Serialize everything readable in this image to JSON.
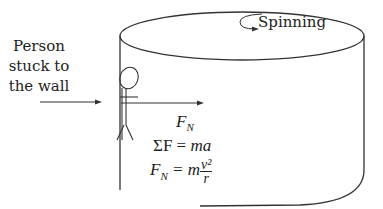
{
  "labels": {
    "person_line1": "Person",
    "person_line2": "stuck to",
    "person_line3": "the wall",
    "spinning": "Spinning"
  },
  "equations": {
    "force_label": "F",
    "force_sub": "N",
    "newton_lhs": "ΣF",
    "newton_eq": " = ",
    "newton_rhs": "ma",
    "centripetal_lhs": "F",
    "centripetal_sub": "N",
    "centripetal_eq": " = m",
    "centripetal_num": "v²",
    "centripetal_den": "r"
  },
  "colors": {
    "stroke": "#333333",
    "text": "#222222"
  }
}
